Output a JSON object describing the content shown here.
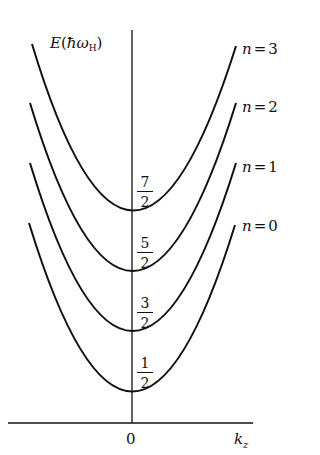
{
  "diagram": {
    "y_axis_label": {
      "symbol": "E",
      "open": "(",
      "hbar_omega": "ħω",
      "subscript": "H",
      "close": ")"
    },
    "x_axis_label": {
      "symbol": "k",
      "subscript": "z"
    },
    "x_tick": "0",
    "levels": [
      {
        "n_label": "n",
        "eq": "=",
        "n_value": "3",
        "energy_num": "7",
        "energy_den": "2"
      },
      {
        "n_label": "n",
        "eq": "=",
        "n_value": "2",
        "energy_num": "5",
        "energy_den": "2"
      },
      {
        "n_label": "n",
        "eq": "=",
        "n_value": "1",
        "energy_num": "3",
        "energy_den": "2"
      },
      {
        "n_label": "n",
        "eq": "=",
        "n_value": "0",
        "energy_num": "1",
        "energy_den": "2"
      }
    ],
    "line_color": "#111111"
  }
}
